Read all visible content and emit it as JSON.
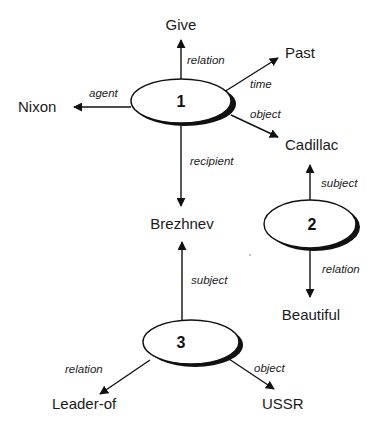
{
  "diagram": {
    "title": "",
    "nodes": [
      {
        "id": "1",
        "label": "1",
        "cx": 181,
        "cy": 101,
        "rx": 50,
        "ry": 22
      },
      {
        "id": "2",
        "label": "2",
        "cx": 310,
        "cy": 224,
        "rx": 46,
        "ry": 24
      },
      {
        "id": "3",
        "label": "3",
        "cx": 191,
        "cy": 342,
        "rx": 48,
        "ry": 22
      }
    ],
    "concepts": {
      "give": "Give",
      "nixon": "Nixon",
      "past": "Past",
      "cadillac": "Cadillac",
      "brezhnev": "Brezhnev",
      "beautiful": "Beautiful",
      "leader_of": "Leader-of",
      "ussr": "USSR"
    },
    "edges": [
      {
        "from": "1",
        "to": "Give",
        "label": "relation"
      },
      {
        "from": "1",
        "to": "Nixon",
        "label": "agent"
      },
      {
        "from": "1",
        "to": "Past",
        "label": "time"
      },
      {
        "from": "1",
        "to": "Cadillac",
        "label": "object"
      },
      {
        "from": "1",
        "to": "Brezhnev",
        "label": "recipient"
      },
      {
        "from": "2",
        "to": "Cadillac",
        "label": "subject"
      },
      {
        "from": "2",
        "to": "Beautiful",
        "label": "relation"
      },
      {
        "from": "3",
        "to": "Brezhnev",
        "label": "subject"
      },
      {
        "from": "3",
        "to": "Leader-of",
        "label": "relation"
      },
      {
        "from": "3",
        "to": "USSR",
        "label": "object"
      }
    ],
    "edge_labels": {
      "n1_relation": "relation",
      "n1_agent": "agent",
      "n1_time": "time",
      "n1_object": "object",
      "n1_recipient": "recipient",
      "n2_subject": "subject",
      "n2_relation": "relation",
      "n3_subject": "subject",
      "n3_relation": "relation",
      "n3_object": "object"
    },
    "node_labels": {
      "n1": "1",
      "n2": "2",
      "n3": "3"
    }
  }
}
